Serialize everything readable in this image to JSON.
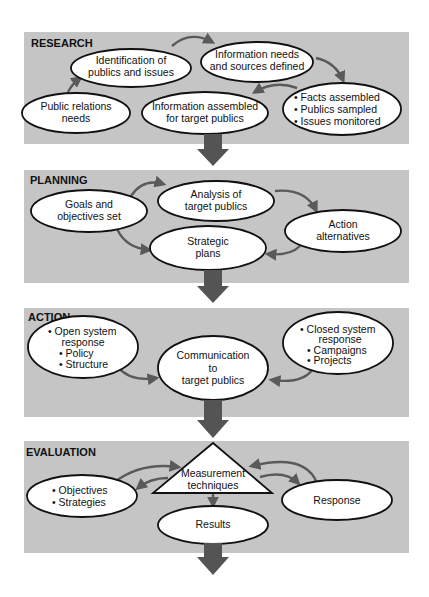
{
  "diagram": {
    "colors": {
      "panel": "#c5c5c5",
      "node_fill": "#ffffff",
      "node_stroke": "#111111",
      "connector": "#5a5a5a",
      "stage_arrow": "#545454"
    },
    "stages": [
      {
        "label": "RESEARCH",
        "nodes": [
          {
            "id": "pr-needs",
            "lines": [
              "Public relations",
              "needs"
            ]
          },
          {
            "id": "identification",
            "lines": [
              "Identification of",
              "publics and issues"
            ]
          },
          {
            "id": "info-needs",
            "lines": [
              "Information needs",
              "and sources defined"
            ]
          },
          {
            "id": "facts",
            "lines": [
              "• Facts assembled",
              "• Publics sampled",
              "• Issues monitored"
            ]
          },
          {
            "id": "info-assembled",
            "lines": [
              "Information assembled",
              "for target publics"
            ]
          }
        ]
      },
      {
        "label": "PLANNING",
        "nodes": [
          {
            "id": "goals",
            "lines": [
              "Goals and",
              "objectives set"
            ]
          },
          {
            "id": "analysis",
            "lines": [
              "Analysis of",
              "target publics"
            ]
          },
          {
            "id": "action-alternatives",
            "lines": [
              "Action",
              "alternatives"
            ]
          },
          {
            "id": "strategic-plans",
            "lines": [
              "Strategic",
              "plans"
            ]
          }
        ]
      },
      {
        "label": "ACTION",
        "nodes": [
          {
            "id": "open-system",
            "lines": [
              "• Open system",
              "response",
              "• Policy",
              "• Structure"
            ]
          },
          {
            "id": "communication",
            "lines": [
              "Communication",
              "to",
              "target publics"
            ]
          },
          {
            "id": "closed-system",
            "lines": [
              "• Closed system",
              "response",
              "• Campaigns",
              "• Projects"
            ]
          }
        ]
      },
      {
        "label": "EVALUATION",
        "nodes": [
          {
            "id": "measurement",
            "lines": [
              "Measurement",
              "techniques"
            ]
          },
          {
            "id": "objectives",
            "lines": [
              "• Objectives",
              "• Strategies"
            ]
          },
          {
            "id": "response",
            "lines": [
              "Response"
            ]
          },
          {
            "id": "results",
            "lines": [
              "Results"
            ]
          }
        ]
      }
    ]
  }
}
